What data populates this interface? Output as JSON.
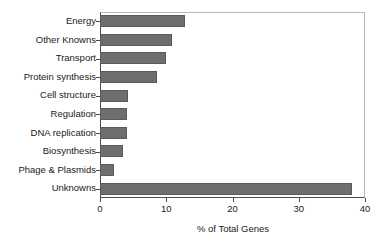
{
  "chart_data": {
    "type": "bar",
    "orientation": "horizontal",
    "title": "",
    "xlabel": "% of Total Genes",
    "ylabel": "",
    "categories": [
      "Energy",
      "Other Knowns",
      "Transport",
      "Protein synthesis",
      "Cell structure",
      "Regulation",
      "DNA replication",
      "Biosynthesis",
      "Phage & Plasmids",
      "Unknowns"
    ],
    "values": [
      12.8,
      10.9,
      9.9,
      8.6,
      4.2,
      4.1,
      4.0,
      3.5,
      2.1,
      38.0
    ],
    "xlim": [
      0,
      40
    ],
    "xticks": [
      0,
      10,
      20,
      30,
      40
    ],
    "xticklabels": [
      "0",
      "10",
      "20",
      "30",
      "40"
    ],
    "grid": false,
    "legend": false,
    "bar_color": "#6e6e6e",
    "bar_edge_color": "#5a5a5a",
    "axis_color": "#4a4a4a",
    "frame_color": "#b9b9b9",
    "background": "#ffffff"
  }
}
